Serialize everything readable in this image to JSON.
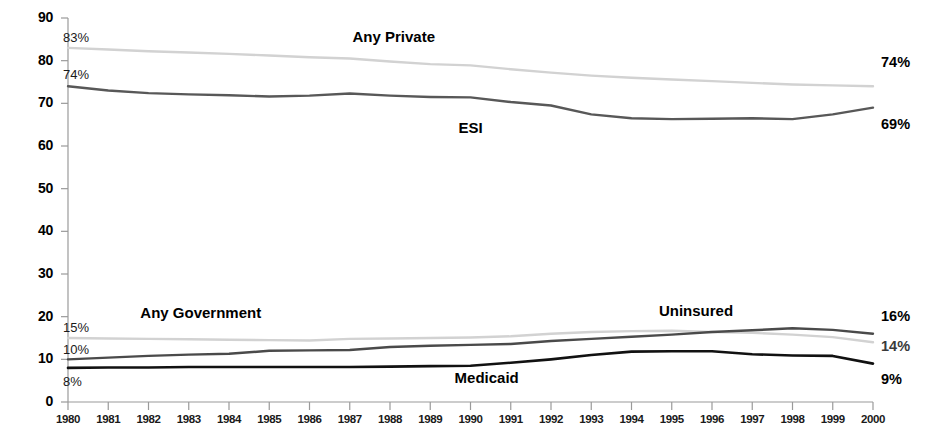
{
  "chart_data": {
    "type": "line",
    "title": "",
    "xlabel": "",
    "ylabel": "",
    "xlim": [
      1980,
      2000
    ],
    "ylim": [
      0,
      90
    ],
    "grid": false,
    "legend_position": "inline-annotations",
    "y_ticks": [
      "0",
      "10",
      "20",
      "30",
      "40",
      "50",
      "60",
      "70",
      "80",
      "90"
    ],
    "categories": [
      "1980",
      "1981",
      "1982",
      "1983",
      "1984",
      "1985",
      "1986",
      "1987",
      "1988",
      "1989",
      "1990",
      "1991",
      "1992",
      "1993",
      "1994",
      "1995",
      "1996",
      "1997",
      "1998",
      "1999",
      "2000"
    ],
    "series": [
      {
        "name": "Any Private",
        "color": "#d2d2d2",
        "width": 2.4,
        "label_text": "Any Private",
        "label_x": 1988.1,
        "label_y": 85.2,
        "start_label": "83%",
        "end_label": "74%",
        "values": [
          83,
          82.6,
          82.2,
          81.9,
          81.6,
          81.2,
          80.8,
          80.5,
          79.8,
          79.2,
          78.9,
          78.0,
          77.2,
          76.5,
          76.0,
          75.6,
          75.2,
          74.8,
          74.4,
          74.2,
          74
        ]
      },
      {
        "name": "ESI",
        "color": "#585858",
        "width": 2.4,
        "label_text": "ESI",
        "label_x": 1990.0,
        "label_y": 64.0,
        "start_label": "74%",
        "end_label": "69%",
        "values": [
          74,
          73.0,
          72.4,
          72.1,
          71.9,
          71.6,
          71.8,
          72.3,
          71.8,
          71.5,
          71.4,
          70.3,
          69.5,
          67.4,
          66.5,
          66.3,
          66.4,
          66.5,
          66.3,
          67.4,
          69
        ]
      },
      {
        "name": "Any Government",
        "color": "#d2d2d2",
        "width": 2.4,
        "label_text": "Any Government",
        "label_x": 1983.3,
        "label_y": 20.6,
        "start_label": "15%",
        "end_label": "14%",
        "values": [
          15,
          14.9,
          14.8,
          14.7,
          14.6,
          14.5,
          14.4,
          14.8,
          14.9,
          15.0,
          15.1,
          15.4,
          16.0,
          16.4,
          16.6,
          16.7,
          16.4,
          16.2,
          15.8,
          15.2,
          14
        ]
      },
      {
        "name": "Uninsured",
        "color": "#4a4a4a",
        "width": 2.4,
        "label_text": "Uninsured",
        "label_x": 1995.6,
        "label_y": 21.0,
        "start_label": "10%",
        "end_label": "16%",
        "values": [
          10,
          10.4,
          10.8,
          11.1,
          11.3,
          12.0,
          12.1,
          12.2,
          12.9,
          13.2,
          13.4,
          13.6,
          14.3,
          14.8,
          15.3,
          15.8,
          16.4,
          16.8,
          17.3,
          16.9,
          16
        ]
      },
      {
        "name": "Medicaid",
        "color": "#111111",
        "width": 2.6,
        "label_text": "Medicaid",
        "label_x": 1990.4,
        "label_y": 5.3,
        "start_label": "8%",
        "end_label": "9%",
        "values": [
          8,
          8.1,
          8.1,
          8.2,
          8.2,
          8.2,
          8.2,
          8.2,
          8.3,
          8.4,
          8.5,
          9.2,
          10.0,
          11.0,
          11.8,
          11.9,
          11.9,
          11.2,
          10.9,
          10.8,
          9
        ]
      }
    ]
  },
  "axis": {
    "y_labels": [
      "90",
      "80",
      "70",
      "60",
      "50",
      "40",
      "30",
      "20",
      "10",
      "0"
    ],
    "x_labels": [
      "1980",
      "1981",
      "1982",
      "1983",
      "1984",
      "1985",
      "1986",
      "1987",
      "1988",
      "1989",
      "1990",
      "1991",
      "1992",
      "1993",
      "1994",
      "1995",
      "1996",
      "1997",
      "1998",
      "1999",
      "2000"
    ]
  },
  "annotations": {
    "any_private_start": "83%",
    "any_private_end": "74%",
    "esi_start": "74%",
    "esi_end": "69%",
    "any_government_start": "15%",
    "any_government_end": "14%",
    "uninsured_start": "10%",
    "uninsured_end": "16%",
    "medicaid_start": "8%",
    "medicaid_end": "9%",
    "label_any_private": "Any Private",
    "label_esi": "ESI",
    "label_any_government": "Any Government",
    "label_uninsured": "Uninsured",
    "label_medicaid": "Medicaid"
  }
}
